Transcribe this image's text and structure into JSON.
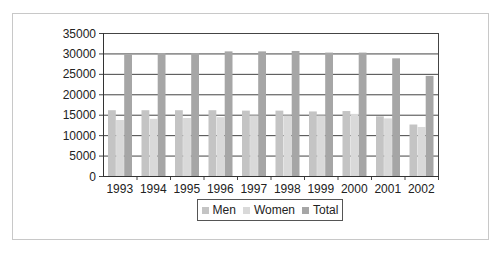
{
  "chart_data": {
    "type": "bar",
    "title": "",
    "xlabel": "",
    "ylabel": "",
    "categories": [
      "1993",
      "1994",
      "1995",
      "1996",
      "1997",
      "1998",
      "1999",
      "2000",
      "2001",
      "2002"
    ],
    "series": [
      {
        "name": "Men",
        "color": "#c4c4c4",
        "values": [
          16100,
          16100,
          16100,
          16100,
          16000,
          16000,
          15800,
          15900,
          14600,
          12600
        ]
      },
      {
        "name": "Women",
        "color": "#d9d9d9",
        "values": [
          13700,
          14000,
          14200,
          14400,
          14800,
          14800,
          14800,
          15200,
          14100,
          12000
        ]
      },
      {
        "name": "Total",
        "color": "#a6a6a6",
        "values": [
          29800,
          30100,
          30100,
          30500,
          30500,
          30600,
          30200,
          30200,
          28800,
          24500
        ]
      }
    ],
    "ylim": [
      0,
      35000
    ],
    "yticks": [
      0,
      5000,
      10000,
      15000,
      20000,
      25000,
      30000,
      35000
    ],
    "grid": true,
    "legend_position": "bottom"
  },
  "legend": {
    "items": [
      {
        "label": "Men"
      },
      {
        "label": "Women"
      },
      {
        "label": "Total"
      }
    ]
  }
}
